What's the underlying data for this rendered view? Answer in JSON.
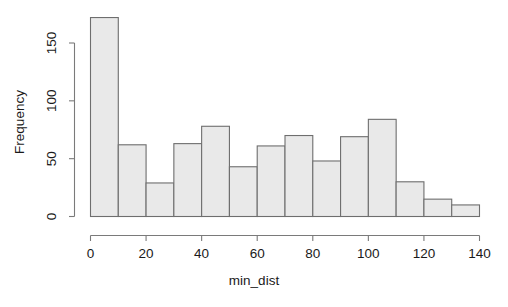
{
  "chart_data": {
    "type": "bar",
    "chart_style": "histogram",
    "title": "",
    "subtitle": "",
    "xlabel": "min_dist",
    "ylabel": "Frequency",
    "xlim": [
      0,
      140
    ],
    "ylim": [
      0,
      172
    ],
    "grid": false,
    "legend": false,
    "legend_position": "none",
    "bin_width": 10,
    "bin_edges": [
      0,
      10,
      20,
      30,
      40,
      50,
      60,
      70,
      80,
      90,
      100,
      110,
      120,
      130,
      140
    ],
    "categories": [
      "0-10",
      "10-20",
      "20-30",
      "30-40",
      "40-50",
      "50-60",
      "60-70",
      "70-80",
      "80-90",
      "90-100",
      "100-110",
      "110-120",
      "120-130",
      "130-140"
    ],
    "bin_centers": [
      5,
      15,
      25,
      35,
      45,
      55,
      65,
      75,
      85,
      95,
      105,
      115,
      125,
      135
    ],
    "values": [
      172,
      62,
      29,
      63,
      78,
      43,
      61,
      70,
      48,
      69,
      84,
      30,
      15,
      10
    ],
    "xticks": [
      0,
      20,
      40,
      60,
      80,
      100,
      120,
      140
    ],
    "xtick_labels": [
      "0",
      "20",
      "40",
      "60",
      "80",
      "100",
      "120",
      "140"
    ],
    "yticks": [
      0,
      50,
      100,
      150
    ],
    "ytick_labels": [
      "0",
      "50",
      "100",
      "150"
    ],
    "colors": {
      "bar_fill": "#e9e9e9",
      "bar_border": "#6e6e6e",
      "axis": "#7a7a7a",
      "text": "#1a1a1a",
      "background": "#ffffff"
    }
  }
}
